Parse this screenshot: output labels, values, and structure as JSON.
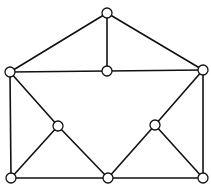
{
  "diagram": {
    "type": "graph",
    "style": {
      "edge_color": "#111111",
      "node_fill": "#ffffff",
      "node_stroke": "#111111",
      "background": "#ffffff"
    },
    "nodes": [
      {
        "id": "top",
        "x": 107,
        "y": 13
      },
      {
        "id": "mid-left",
        "x": 10,
        "y": 72
      },
      {
        "id": "mid-center",
        "x": 107,
        "y": 71
      },
      {
        "id": "mid-right",
        "x": 203,
        "y": 70
      },
      {
        "id": "inner-left",
        "x": 58,
        "y": 126
      },
      {
        "id": "inner-right",
        "x": 155,
        "y": 125
      },
      {
        "id": "bottom-left",
        "x": 11,
        "y": 178
      },
      {
        "id": "bottom-center",
        "x": 108,
        "y": 178
      },
      {
        "id": "bottom-right",
        "x": 203,
        "y": 178
      }
    ],
    "edges": [
      [
        "top",
        "mid-left"
      ],
      [
        "top",
        "mid-center"
      ],
      [
        "top",
        "mid-right"
      ],
      [
        "mid-left",
        "mid-center"
      ],
      [
        "mid-center",
        "mid-right"
      ],
      [
        "mid-left",
        "bottom-left"
      ],
      [
        "mid-left",
        "inner-left"
      ],
      [
        "inner-left",
        "bottom-left"
      ],
      [
        "inner-left",
        "bottom-center"
      ],
      [
        "bottom-left",
        "bottom-center"
      ],
      [
        "bottom-center",
        "bottom-right"
      ],
      [
        "bottom-center",
        "inner-right"
      ],
      [
        "inner-right",
        "mid-right"
      ],
      [
        "inner-right",
        "bottom-right"
      ],
      [
        "mid-right",
        "bottom-right"
      ]
    ]
  }
}
